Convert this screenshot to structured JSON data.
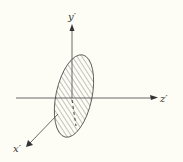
{
  "diagram": {
    "type": "3d-axes-with-hatched-ellipse",
    "background": "#fdfcf5",
    "line_color": "#444444",
    "axes": [
      {
        "name": "y-axis",
        "label": "y′",
        "direction": "up"
      },
      {
        "name": "z-axis",
        "label": "z′",
        "direction": "right"
      },
      {
        "name": "x-axis",
        "label": "x′",
        "direction": "down-left"
      }
    ],
    "shape": {
      "kind": "ellipse",
      "fill": "diagonal-hatch",
      "plane": "x′y′"
    }
  }
}
